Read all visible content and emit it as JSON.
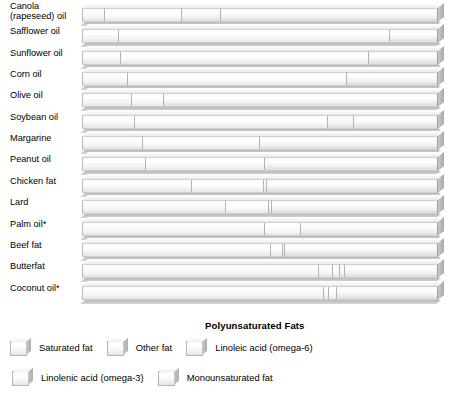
{
  "chart_data": {
    "type": "bar",
    "subtype": "stacked-horizontal-100-percent",
    "title": "",
    "xlabel": "",
    "ylabel": "",
    "xlim": [
      0,
      100
    ],
    "grid": false,
    "legend_position": "bottom-left",
    "axis_caption": "Polyunsaturated Fats",
    "categories": [
      "Canola\n(rapeseed) oil",
      "Safflower oil",
      "Sunflower oil",
      "Corn oil",
      "Olive oil",
      "Soybean oil",
      "Margarine",
      "Peanut oil",
      "Chicken fat",
      "Lard",
      "Palm oil*",
      "Beef fat",
      "Butterfat",
      "Coconut oil*"
    ],
    "series": [
      {
        "name": "Saturated fat",
        "key": "sat",
        "values": [
          6.5,
          10.5,
          11.0,
          13.0,
          14.0,
          15.0,
          17.0,
          18.0,
          31.0,
          40.5,
          51.5,
          53.0,
          66.5,
          68.0
        ]
      },
      {
        "name": "Other fat",
        "key": "other",
        "values": [
          0,
          0,
          0,
          0,
          0,
          0,
          0,
          0,
          0,
          0,
          0,
          0,
          4.0,
          1.5
        ]
      },
      {
        "name": "Linoleic acid (omega-6)",
        "key": "la",
        "values": [
          21.5,
          76.0,
          69.5,
          61.5,
          9.0,
          54.0,
          33.0,
          33.5,
          20.0,
          12.0,
          10.0,
          3.5,
          2.0,
          2.0
        ]
      },
      {
        "name": "Linolenic acid (omega-3)",
        "key": "ala",
        "values": [
          11.0,
          0,
          0,
          0,
          0,
          7.5,
          0,
          0,
          1.0,
          1.0,
          0,
          0.5,
          1.5,
          0
        ]
      },
      {
        "name": "Monounsaturated fat",
        "key": "mono",
        "values": [
          61.0,
          13.5,
          19.5,
          25.5,
          77.0,
          23.5,
          50.0,
          48.5,
          48.0,
          46.5,
          38.5,
          43.0,
          26.0,
          28.5
        ]
      }
    ]
  },
  "legend": {
    "rows": [
      [
        {
          "label": "Saturated fat",
          "key": "sat"
        },
        {
          "label": "Other fat",
          "key": "other"
        },
        {
          "label": "Linoleic acid (omega-6)",
          "key": "la"
        }
      ],
      [
        {
          "label": "Linolenic acid (omega-3)",
          "key": "ala"
        },
        {
          "label": "Monounsaturated fat",
          "key": "mono"
        }
      ]
    ]
  },
  "colors": {
    "fill_light": "#ffffff",
    "fill_mid": "#f2f2f2",
    "fill_dark": "#e2e2e2",
    "outline": "#b3b3b3",
    "shadow": "#b9b9b9",
    "text": "#000000"
  }
}
